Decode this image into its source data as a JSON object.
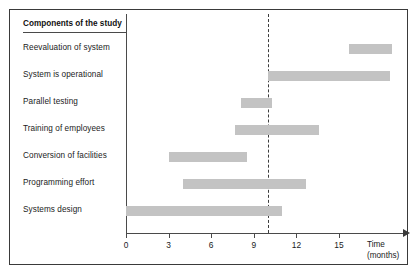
{
  "chart_data": {
    "type": "bar",
    "subtype": "gantt",
    "title": "",
    "column_header": "Components of the study",
    "xlabel": "Time",
    "xlabel_unit": "(months)",
    "ylabel": "",
    "xlim": [
      0,
      19.5
    ],
    "xticks": [
      0,
      3,
      6,
      9,
      12,
      15
    ],
    "xtick_labels": [
      "0",
      "3",
      "6",
      "9",
      "12",
      "15"
    ],
    "grid": false,
    "legend": "none",
    "bar_color": "#c3c3c3",
    "axis_color": "#4a4a4a",
    "marker_line": {
      "label": "current time",
      "value": 10,
      "style": "dashed",
      "color": "#3d3d3d"
    },
    "categories": [
      "Reevaluation of system",
      "System is operational",
      "Parallel testing",
      "Training of employees",
      "Conversion of facilities",
      "Programming effort",
      "Systems design"
    ],
    "tasks": [
      {
        "name": "Reevaluation of system",
        "start": 15.7,
        "end": 18.7,
        "duration": 3.0
      },
      {
        "name": "System is operational",
        "start": 10.0,
        "end": 18.6,
        "duration": 8.6
      },
      {
        "name": "Parallel testing",
        "start": 8.1,
        "end": 10.3,
        "duration": 2.2
      },
      {
        "name": "Training of employees",
        "start": 7.7,
        "end": 13.6,
        "duration": 5.9
      },
      {
        "name": "Conversion of facilities",
        "start": 3.0,
        "end": 8.5,
        "duration": 5.5
      },
      {
        "name": "Programming effort",
        "start": 4.0,
        "end": 12.7,
        "duration": 8.7
      },
      {
        "name": "Systems design",
        "start": 0.0,
        "end": 11.0,
        "duration": 11.0
      }
    ]
  }
}
